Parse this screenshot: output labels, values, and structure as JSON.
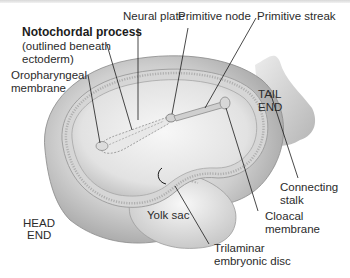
{
  "figure": {
    "labels": {
      "notochordal_process": "Notochordal process",
      "notochordal_note_1": "(outlined beneath",
      "notochordal_note_2": "ectoderm)",
      "neural_plate": "Neural plate",
      "primitive_node": "Primitive node",
      "primitive_streak": "Primitive streak",
      "oropharyngeal_1": "Oropharyngeal",
      "oropharyngeal_2": "membrane",
      "tail_1": "TAIL",
      "tail_2": "END",
      "connecting_1": "Connecting",
      "connecting_2": "stalk",
      "head_1": "HEAD",
      "head_2": "END",
      "yolk_sac": "Yolk sac",
      "cloacal_1": "Cloacal",
      "cloacal_2": "membrane",
      "trilaminar_1": "Trilaminar",
      "trilaminar_2": "embryonic disc"
    },
    "colors": {
      "background": "#ffffff",
      "tissue_light": "#ececec",
      "tissue_mid": "#c8c8c8",
      "tissue_dark": "#8e8e8e",
      "leader_line": "#1a1a1a"
    }
  }
}
